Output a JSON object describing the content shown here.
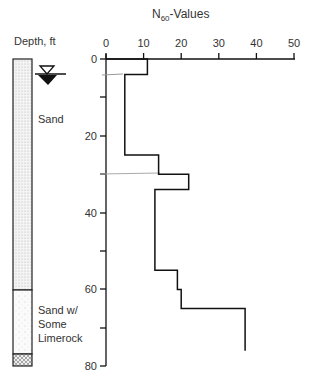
{
  "title": "N60-Values",
  "title_main": "N",
  "title_sub": "60",
  "title_rest": "-Values",
  "depth_label": "Depth, ft",
  "x_ticks": [
    "0",
    "10",
    "20",
    "30",
    "40",
    "50"
  ],
  "y_ticks": [
    "0",
    "20",
    "40",
    "60",
    "80"
  ],
  "layers": [
    {
      "label": "Sand",
      "top": 0,
      "bottom": 60
    },
    {
      "label": "Sand w/",
      "label2": "Some",
      "label3": "Limerock",
      "top": 60,
      "bottom": 80
    }
  ],
  "water_table_symbol": "water-table",
  "chart_data": {
    "type": "line",
    "title": "N60-Values",
    "xlabel": "N60-Values",
    "ylabel": "Depth, ft",
    "xlim": [
      0,
      50
    ],
    "ylim": [
      80,
      0
    ],
    "profile": [
      {
        "depth_top": 0,
        "depth_bottom": 4,
        "N60": 11
      },
      {
        "depth_top": 4,
        "depth_bottom": 25,
        "N60": 5
      },
      {
        "depth_top": 25,
        "depth_bottom": 30,
        "N60": 14
      },
      {
        "depth_top": 30,
        "depth_bottom": 34,
        "N60": 22
      },
      {
        "depth_top": 34,
        "depth_bottom": 55,
        "N60": 13
      },
      {
        "depth_top": 55,
        "depth_bottom": 60,
        "N60": 19
      },
      {
        "depth_top": 60,
        "depth_bottom": 65,
        "N60": 20
      },
      {
        "depth_top": 65,
        "depth_bottom": 76,
        "N60": 37
      }
    ],
    "water_table_depth": 4
  }
}
